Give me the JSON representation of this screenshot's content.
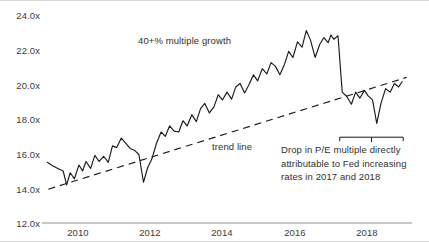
{
  "chart_data": {
    "type": "line",
    "title": "",
    "subtitle": "",
    "xlabel": "",
    "ylabel": "",
    "grid": false,
    "legend_position": "none",
    "xlim": [
      2008.8,
      2019.3
    ],
    "ylim": [
      12.0,
      24.0
    ],
    "y_ticks": [
      "24.0x",
      "22.0x",
      "20.0x",
      "18.0x",
      "16.0x",
      "14.0x",
      "12.0x"
    ],
    "y_tick_values": [
      24.0,
      22.0,
      20.0,
      18.0,
      16.0,
      14.0,
      12.0
    ],
    "x_ticks": [
      "2010",
      "2012",
      "2014",
      "2016",
      "2018"
    ],
    "x_tick_values": [
      2010,
      2012,
      2014,
      2016,
      2018
    ],
    "series": [
      {
        "name": "P/E multiple",
        "type": "line",
        "color": "#1a1a1a",
        "x": [
          2008.95,
          2009.1,
          2009.25,
          2009.4,
          2009.5,
          2009.6,
          2009.72,
          2009.85,
          2009.95,
          2010.05,
          2010.18,
          2010.3,
          2010.42,
          2010.55,
          2010.68,
          2010.8,
          2010.92,
          2011.05,
          2011.18,
          2011.3,
          2011.42,
          2011.55,
          2011.68,
          2011.8,
          2011.92,
          2012.05,
          2012.18,
          2012.3,
          2012.42,
          2012.55,
          2012.68,
          2012.8,
          2012.92,
          2013.05,
          2013.18,
          2013.3,
          2013.42,
          2013.55,
          2013.68,
          2013.8,
          2013.92,
          2014.05,
          2014.18,
          2014.3,
          2014.42,
          2014.55,
          2014.68,
          2014.8,
          2014.92,
          2015.05,
          2015.18,
          2015.3,
          2015.42,
          2015.55,
          2015.68,
          2015.8,
          2015.92,
          2016.05,
          2016.18,
          2016.3,
          2016.42,
          2016.55,
          2016.68,
          2016.8,
          2016.92,
          2017.0,
          2017.08,
          2017.2,
          2017.32,
          2017.45,
          2017.58,
          2017.7,
          2017.82,
          2017.95,
          2018.05,
          2018.18,
          2018.3,
          2018.42,
          2018.55,
          2018.68,
          2018.8,
          2018.92,
          2019.02
        ],
        "y": [
          15.5,
          15.3,
          15.15,
          15.0,
          14.2,
          14.9,
          14.55,
          15.35,
          15.0,
          15.55,
          15.15,
          15.9,
          15.55,
          15.85,
          15.5,
          16.45,
          16.35,
          16.9,
          16.6,
          16.3,
          16.2,
          15.95,
          14.35,
          15.2,
          15.7,
          16.6,
          17.25,
          17.0,
          17.6,
          17.3,
          17.25,
          17.9,
          17.6,
          18.25,
          17.85,
          18.6,
          18.9,
          18.35,
          18.7,
          19.4,
          19.1,
          19.55,
          19.15,
          19.85,
          20.05,
          19.5,
          20.0,
          20.55,
          20.2,
          20.9,
          20.6,
          21.25,
          21.05,
          20.55,
          21.15,
          21.9,
          21.55,
          22.45,
          22.15,
          23.1,
          22.55,
          21.55,
          22.3,
          22.7,
          22.4,
          22.85,
          22.6,
          22.8,
          19.55,
          19.3,
          18.85,
          19.55,
          19.2,
          19.65,
          19.35,
          19.1,
          17.75,
          18.9,
          19.75,
          19.55,
          20.05,
          19.85,
          20.15
        ]
      },
      {
        "name": "trend line",
        "type": "line",
        "style": "dashed",
        "color": "#1a1a1a",
        "x": [
          2008.98,
          2019.15
        ],
        "y": [
          13.95,
          20.4
        ]
      }
    ],
    "annotations": [
      {
        "id": "growth-annotation",
        "text": "40+% multiple growth",
        "x": 2012.35,
        "y": 22.35
      },
      {
        "id": "trend-line-annotation",
        "text": "trend line",
        "x": 2013.9,
        "y": 16.3
      },
      {
        "id": "drop-annotation",
        "text": "Drop in P/E multiple directly attributable to Fed increasing rates in 2017 and 2018",
        "x": 2016.85,
        "y": 15.4,
        "bracket": {
          "x_start": 2017.25,
          "x_end": 2019.05,
          "y": 16.95
        }
      }
    ]
  },
  "axis": {
    "axis_color": "#8f8f8f",
    "text_color": "#3b3b3b",
    "line_color": "#1a1a1a"
  }
}
